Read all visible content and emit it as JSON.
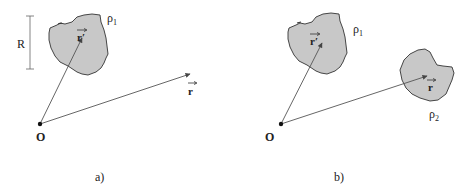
{
  "colors": {
    "blob_fill": "#c8c8c8",
    "blob_stroke": "#333333",
    "line": "#555555",
    "text": "#222222"
  },
  "panel_a": {
    "caption": "a)",
    "origin_label": "O",
    "scale_label": "R",
    "density_label": "ρ",
    "density_sub": "1",
    "source_vector_label": "r",
    "source_vector_prime": "′",
    "field_vector_label": "r"
  },
  "panel_b": {
    "caption": "b)",
    "origin_label": "O",
    "density1_label": "ρ",
    "density1_sub": "1",
    "density2_label": "ρ",
    "density2_sub": "2",
    "source_vector_label": "r",
    "source_vector_prime": "′",
    "field_vector_label": "r"
  }
}
